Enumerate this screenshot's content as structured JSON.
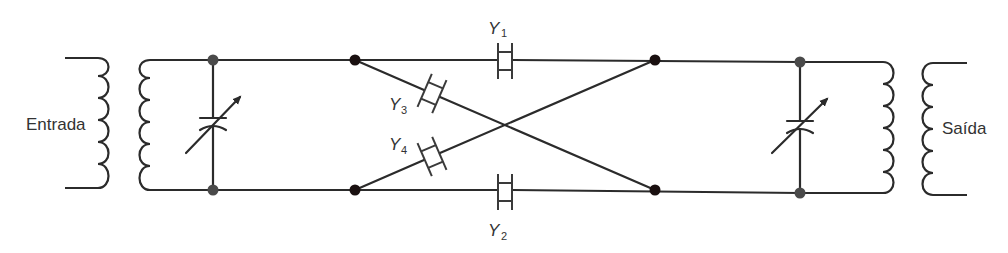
{
  "diagram": {
    "type": "circuit-schematic",
    "labels": {
      "input": "Entrada",
      "output": "Saída",
      "y1": {
        "main": "Y",
        "sub": "1"
      },
      "y2": {
        "main": "Y",
        "sub": "2"
      },
      "y3": {
        "main": "Y",
        "sub": "3"
      },
      "y4": {
        "main": "Y",
        "sub": "4"
      }
    },
    "components": [
      {
        "id": "T-in",
        "kind": "transformer",
        "label": "Entrada"
      },
      {
        "id": "C-in",
        "kind": "variable-capacitor"
      },
      {
        "id": "Y1",
        "kind": "crystal",
        "position": "top series arm"
      },
      {
        "id": "Y2",
        "kind": "crystal",
        "position": "bottom series arm"
      },
      {
        "id": "Y3",
        "kind": "crystal",
        "position": "diagonal top-left to bottom-right"
      },
      {
        "id": "Y4",
        "kind": "crystal",
        "position": "diagonal bottom-left to top-right"
      },
      {
        "id": "C-out",
        "kind": "variable-capacitor"
      },
      {
        "id": "T-out",
        "kind": "transformer",
        "label": "Saída"
      }
    ],
    "colors": {
      "wire": "#2b2b2b",
      "node_black": "#1a1010",
      "node_grey": "#4a4a4a",
      "background": "#ffffff"
    }
  }
}
